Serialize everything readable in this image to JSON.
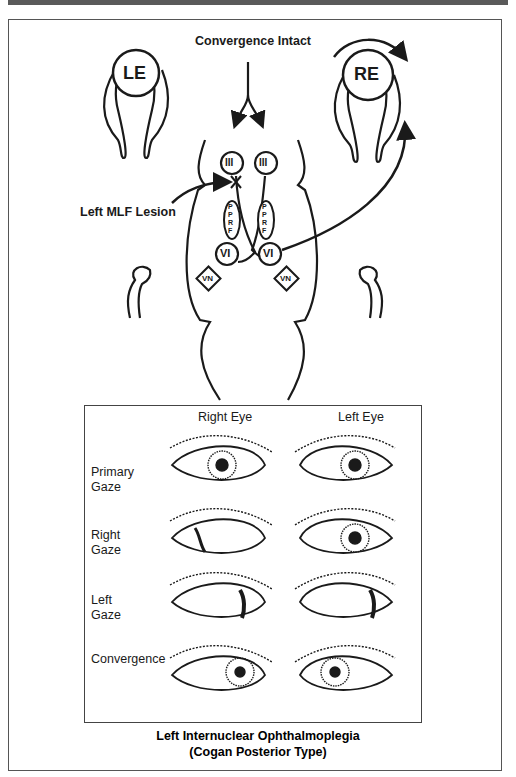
{
  "diagram": {
    "title_top": "Convergence Intact",
    "lesion_label": "Left MLF Lesion",
    "eyes": {
      "left": "LE",
      "right": "RE"
    },
    "nuclei": {
      "oculomotor_left": "III",
      "oculomotor_right": "III",
      "pprf_left": "PPRF",
      "pprf_right": "PPRF",
      "abducens_left": "VI",
      "abducens_right": "VI",
      "vestibular_left": "VN",
      "vestibular_right": "VN"
    }
  },
  "eye_panel": {
    "columns": [
      "Right Eye",
      "Left Eye"
    ],
    "rows": [
      {
        "label_line1": "Primary",
        "label_line2": "Gaze",
        "right_eye": "center",
        "left_eye": "center"
      },
      {
        "label_line1": "Right",
        "label_line2": "Gaze",
        "right_eye": "abducted-right",
        "left_eye": "center (fails to adduct)"
      },
      {
        "label_line1": "Left",
        "label_line2": "Gaze",
        "right_eye": "adducted-left",
        "left_eye": "abducted-left"
      },
      {
        "label_line1": "Convergence",
        "label_line2": "",
        "right_eye": "converged",
        "left_eye": "converged"
      }
    ]
  },
  "caption": {
    "line1": "Left Internuclear Ophthalmoplegia",
    "line2": "(Cogan Posterior Type)"
  },
  "colors": {
    "ink": "#1a1a1a",
    "frame": "#555555",
    "top_bar": "#5a5a5a"
  }
}
